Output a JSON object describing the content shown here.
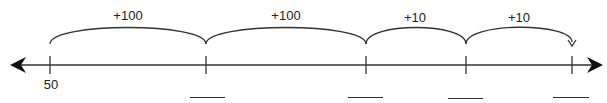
{
  "number_line": {
    "start_label": "50",
    "ticks": [
      {
        "x": 50,
        "label": "50"
      },
      {
        "x": 206,
        "label": ""
      },
      {
        "x": 366,
        "label": ""
      },
      {
        "x": 466,
        "label": ""
      },
      {
        "x": 572,
        "label": ""
      }
    ],
    "jumps": [
      {
        "label": "+100",
        "from_x": 50,
        "to_x": 206
      },
      {
        "label": "+100",
        "from_x": 206,
        "to_x": 366
      },
      {
        "label": "+10",
        "from_x": 366,
        "to_x": 466
      },
      {
        "label": "+10",
        "from_x": 466,
        "to_x": 572
      }
    ],
    "answer_blanks": 4,
    "line_color": "#222222"
  }
}
